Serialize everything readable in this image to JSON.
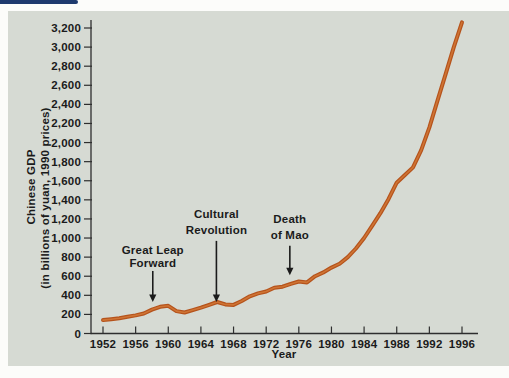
{
  "page": {
    "top_rule_color": "#1e3a6e",
    "panel_color": "#d6dad3",
    "axis_color": "#2e2e2e",
    "text_color": "#1b1b1b"
  },
  "chart_data": {
    "type": "line",
    "title": "",
    "xlabel": "Year",
    "ylabel_line1": "Chinese GDP",
    "ylabel_line2": "(in billions of yuan, 1990 prices)",
    "xlim": [
      1952,
      1996
    ],
    "ylim": [
      0,
      3200
    ],
    "grid": false,
    "legend": "none",
    "x_ticks": [
      1952,
      1956,
      1960,
      1964,
      1968,
      1972,
      1976,
      1980,
      1984,
      1988,
      1992,
      1996
    ],
    "y_ticks": [
      0,
      200,
      400,
      600,
      800,
      1000,
      1200,
      1400,
      1600,
      1800,
      2000,
      2200,
      2400,
      2600,
      2800,
      3000,
      3200
    ],
    "line_color": "#b5531c",
    "line_highlight_color": "#cf7434",
    "series": [
      {
        "name": "Chinese GDP",
        "x": [
          1952,
          1953,
          1954,
          1955,
          1956,
          1957,
          1958,
          1959,
          1960,
          1961,
          1962,
          1963,
          1964,
          1965,
          1966,
          1967,
          1968,
          1969,
          1970,
          1971,
          1972,
          1973,
          1974,
          1975,
          1976,
          1977,
          1978,
          1979,
          1980,
          1981,
          1982,
          1983,
          1984,
          1985,
          1986,
          1987,
          1988,
          1989,
          1990,
          1991,
          1992,
          1993,
          1994,
          1995,
          1996
        ],
        "values": [
          140,
          150,
          160,
          175,
          190,
          210,
          250,
          280,
          290,
          235,
          220,
          245,
          270,
          300,
          330,
          305,
          300,
          340,
          390,
          420,
          440,
          480,
          490,
          520,
          545,
          535,
          600,
          640,
          690,
          730,
          800,
          890,
          1000,
          1130,
          1260,
          1410,
          1580,
          1660,
          1740,
          1920,
          2160,
          2440,
          2720,
          3000,
          3260
        ]
      }
    ],
    "annotations": [
      {
        "lines": [
          "Great Leap",
          "Forward"
        ],
        "year": 1958.1,
        "line_values": [
          875,
          735
        ],
        "arrow_from": 655,
        "arrow_to": 330
      },
      {
        "lines": [
          "Cultural",
          "Revolution"
        ],
        "year": 1965.9,
        "line_values": [
          1250,
          1085
        ],
        "arrow_from": 970,
        "arrow_to": 330
      },
      {
        "lines": [
          "Death",
          "of Mao"
        ],
        "year": 1974.9,
        "line_values": [
          1200,
          1035
        ],
        "arrow_from": 920,
        "arrow_to": 610
      }
    ]
  }
}
